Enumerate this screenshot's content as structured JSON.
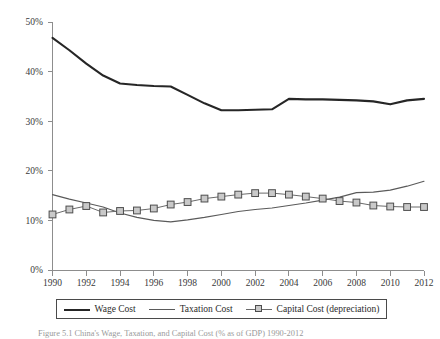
{
  "figure": {
    "caption": "Figure 5.1 China's Wage, Taxation, and Capital Cost (% as of GDP) 1990-2012"
  },
  "legend": {
    "position": "bottom",
    "entries": [
      {
        "label": "Wage Cost",
        "marker": "line",
        "color": "#262626"
      },
      {
        "label": "Taxation Cost",
        "marker": "line",
        "color": "#5a5a5a"
      },
      {
        "label": "Capital Cost (depreciation)",
        "marker": "line-square",
        "color": "#6a6a6a"
      }
    ]
  },
  "chart_data": {
    "type": "line",
    "title": "",
    "xlabel": "",
    "ylabel": "",
    "xlim": [
      1990,
      2012
    ],
    "ylim": [
      0,
      50
    ],
    "grid": false,
    "ytick_labels": [
      "0%",
      "10%",
      "20%",
      "30%",
      "40%",
      "50%"
    ],
    "ytick_values": [
      0,
      10,
      20,
      30,
      40,
      50
    ],
    "xtick_labels": [
      "1990",
      "1992",
      "1994",
      "1996",
      "1998",
      "2000",
      "2002",
      "2004",
      "2006",
      "2008",
      "2010",
      "2012"
    ],
    "xtick_values": [
      1990,
      1992,
      1994,
      1996,
      1998,
      2000,
      2002,
      2004,
      2006,
      2008,
      2010,
      2012
    ],
    "x": [
      1990,
      1991,
      1992,
      1993,
      1994,
      1995,
      1996,
      1997,
      1998,
      1999,
      2000,
      2001,
      2002,
      2003,
      2004,
      2005,
      2006,
      2007,
      2008,
      2009,
      2010,
      2011,
      2012
    ],
    "series": [
      {
        "name": "Wage Cost",
        "color": "#262626",
        "marker": "none",
        "values": [
          46.8,
          44.3,
          41.6,
          39.2,
          37.6,
          37.3,
          37.1,
          37.0,
          35.3,
          33.6,
          32.2,
          32.2,
          32.3,
          32.4,
          34.5,
          34.4,
          34.4,
          34.3,
          34.2,
          34.0,
          33.4,
          34.2,
          34.5
        ]
      },
      {
        "name": "Taxation Cost",
        "color": "#5a5a5a",
        "marker": "none",
        "values": [
          15.2,
          14.3,
          13.5,
          12.7,
          11.5,
          10.6,
          10.0,
          9.7,
          10.1,
          10.6,
          11.2,
          11.8,
          12.2,
          12.5,
          13.0,
          13.5,
          14.1,
          14.7,
          15.6,
          15.7,
          16.1,
          16.9,
          17.9
        ]
      },
      {
        "name": "Capital Cost (depreciation)",
        "color": "#6a6a6a",
        "marker": "square",
        "values": [
          11.2,
          12.2,
          12.9,
          11.6,
          11.9,
          12.0,
          12.4,
          13.2,
          13.7,
          14.4,
          14.8,
          15.2,
          15.5,
          15.5,
          15.2,
          14.8,
          14.4,
          13.9,
          13.6,
          13.0,
          12.8,
          12.7,
          12.7
        ]
      }
    ]
  }
}
